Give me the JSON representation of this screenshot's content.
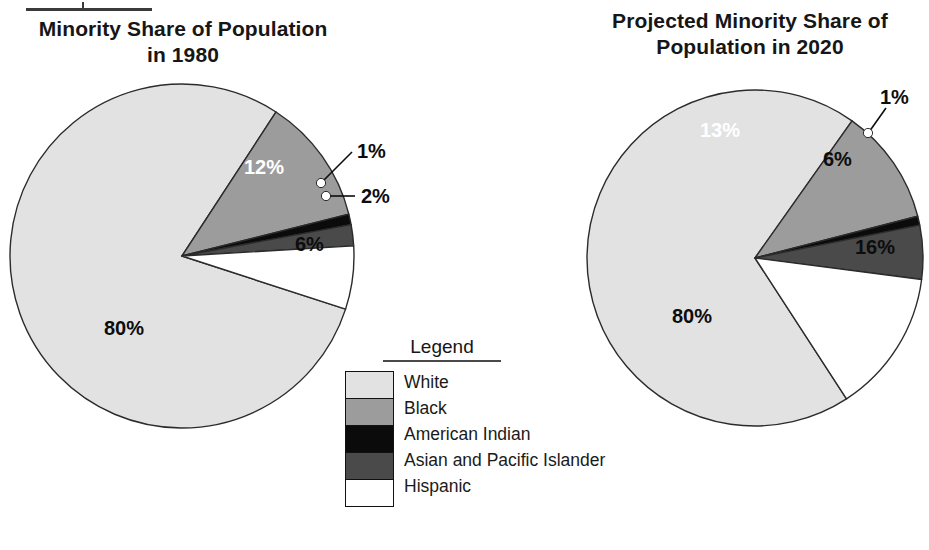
{
  "artifact": {
    "top_rule": "cropped-heading-underline"
  },
  "charts": [
    {
      "title_line1": "Minority Share of Population",
      "title_line2": "in 1980",
      "labels": {
        "white": "80%",
        "black": "12%",
        "american_indian": "1%",
        "asian_pacific": "2%",
        "hispanic": "6%"
      }
    },
    {
      "title_line1": "Projected Minority Share of",
      "title_line2": "Population in 2020",
      "labels": {
        "white": "80%",
        "black": "13%",
        "american_indian": "1%",
        "asian_pacific": "6%",
        "hispanic": "16%"
      }
    }
  ],
  "legend": {
    "title": "Legend",
    "items": [
      {
        "label": "White",
        "color": "#e2e2e2"
      },
      {
        "label": "Black",
        "color": "#9c9c9c"
      },
      {
        "label": "American Indian",
        "color": "#0b0b0b"
      },
      {
        "label": "Asian and Pacific Islander",
        "color": "#4a4a4a"
      },
      {
        "label": "Hispanic",
        "color": "#ffffff"
      }
    ]
  },
  "colors": {
    "white_cat": "#e2e2e2",
    "black_cat": "#9c9c9c",
    "american_indian_cat": "#0b0b0b",
    "asian_pacific_cat": "#4a4a4a",
    "hispanic_cat": "#ffffff",
    "outline": "#2b2b2b",
    "text": "#111111"
  },
  "chart_data": [
    {
      "type": "pie",
      "title": "Minority Share of Population in 1980",
      "categories": [
        "White",
        "Black",
        "American Indian",
        "Asian and Pacific Islander",
        "Hispanic"
      ],
      "values": [
        80,
        12,
        1,
        2,
        6
      ],
      "unit": "percent",
      "data_labels": [
        "80%",
        "12%",
        "1%",
        "2%",
        "6%"
      ],
      "legend_position": "center-between-charts",
      "grid": false
    },
    {
      "type": "pie",
      "title": "Projected Minority Share of Population in 2020",
      "categories": [
        "White",
        "Black",
        "American Indian",
        "Asian and Pacific Islander",
        "Hispanic"
      ],
      "values": [
        80,
        13,
        1,
        6,
        16
      ],
      "unit": "percent",
      "data_labels": [
        "80%",
        "13%",
        "1%",
        "6%",
        "16%"
      ],
      "legend_position": "center-between-charts",
      "grid": false
    }
  ]
}
